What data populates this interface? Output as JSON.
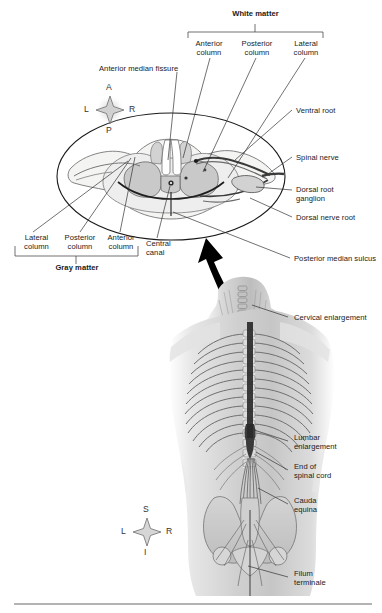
{
  "figure": {
    "title_white_matter": "White matter",
    "title_gray_matter": "Gray matter"
  },
  "white_matter_columns": [
    {
      "line1": "Anterior",
      "line2": "column"
    },
    {
      "line1": "Posterior",
      "line2": "column"
    },
    {
      "line1": "Lateral",
      "line2": "column"
    }
  ],
  "gray_matter_columns": [
    {
      "line1": "Lateral",
      "line2": "column"
    },
    {
      "line1": "Posterior",
      "line2": "column"
    },
    {
      "line1": "Anterior",
      "line2": "column"
    }
  ],
  "cross_section_labels": {
    "anterior_median_fissure": "Anterior median fissure",
    "ventral_root": "Ventral root",
    "spinal_nerve": "Spinal nerve",
    "dorsal_root_ganglion_l1": "Dorsal root",
    "dorsal_root_ganglion_l2": "ganglion",
    "dorsal_nerve_root": "Dorsal nerve root",
    "posterior_median_sulcus": "Posterior median sulcus",
    "central_canal_l1": "Central",
    "central_canal_l2": "canal"
  },
  "body_labels": {
    "cervical_enlargement": "Cervical enlargement",
    "lumbar_enlargement_l1": "Lumbar",
    "lumbar_enlargement_l2": "enlargement",
    "end_of_spinal_cord_l1": "End of",
    "end_of_spinal_cord_l2": "spinal cord",
    "cauda_equina_l1": "Cauda",
    "cauda_equina_l2": "equina",
    "filum_terminale_l1": "Filum",
    "filum_terminale_l2": "terminale"
  },
  "compass_top": {
    "name": "anterior-posterior-compass",
    "up": "A",
    "down": "P",
    "left": "L",
    "right": "R"
  },
  "compass_bottom": {
    "name": "superior-inferior-compass",
    "up": "S",
    "down": "I",
    "left": "L",
    "right": "R"
  },
  "colors": {
    "page_background": "#ffffff",
    "ink": "#1a1a1a",
    "leader_line": "#3a3a3a",
    "white_matter_fill": "#f2f2f1",
    "gray_matter_fill": "#c9c9c9",
    "mid_gray": "#d9d9d9",
    "arrow": "#000000",
    "rule": "#9a9a9a",
    "body_tone": "#cfcfcf"
  }
}
